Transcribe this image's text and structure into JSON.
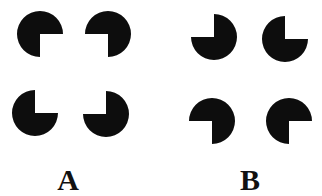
{
  "figure": {
    "background": "#ffffff",
    "shape_color": "#0d0d0d",
    "radius": 23,
    "panels": [
      {
        "label": "A",
        "label_position": [
          68,
          190
        ],
        "inducers": [
          {
            "name": "top-left",
            "cx": 40,
            "cy": 34,
            "missing_quadrant": "bottom-right"
          },
          {
            "name": "top-right",
            "cx": 108,
            "cy": 34,
            "missing_quadrant": "bottom-left"
          },
          {
            "name": "bottom-left",
            "cx": 35,
            "cy": 113,
            "missing_quadrant": "top-right"
          },
          {
            "name": "bottom-right",
            "cx": 106,
            "cy": 114,
            "missing_quadrant": "top-left"
          }
        ]
      },
      {
        "label": "B",
        "label_position": [
          250,
          190
        ],
        "inducers": [
          {
            "name": "top-left",
            "cx": 214,
            "cy": 37,
            "missing_quadrant": "top-left"
          },
          {
            "name": "top-right",
            "cx": 285,
            "cy": 39,
            "missing_quadrant": "top-right"
          },
          {
            "name": "bottom-left",
            "cx": 212,
            "cy": 121,
            "missing_quadrant": "bottom-left"
          },
          {
            "name": "bottom-right",
            "cx": 289,
            "cy": 121,
            "missing_quadrant": "bottom-right"
          }
        ]
      }
    ]
  }
}
